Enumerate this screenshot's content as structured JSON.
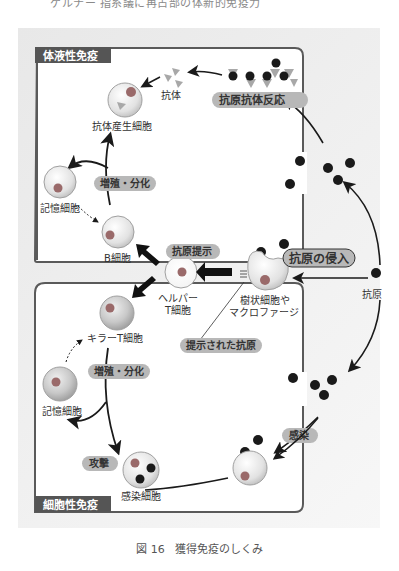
{
  "heading_cut": "ゲルナー 指系議に再占部の体新的免疫力",
  "sections": {
    "humoral": "体液性免疫",
    "cellular": "細胞性免疫"
  },
  "cells": {
    "antibody": "抗体",
    "plasma_cell": "抗体産生細胞",
    "memory_b": "記憶細胞",
    "b_cell": "B細胞",
    "helper_t_line1": "ヘルパー",
    "helper_t_line2": "T細胞",
    "dendritic_line1": "樹状細胞や",
    "dendritic_line2": "マクロファージ",
    "antigen": "抗原",
    "killer_t": "キラーT細胞",
    "memory_t": "記憶細胞",
    "infected_cell": "感染細胞"
  },
  "badges": {
    "ag_ab_reaction": "抗原抗体反応",
    "proliferation_humoral": "増殖・分化",
    "antigen_presentation": "抗原提示",
    "antigen_invasion": "抗原の侵入",
    "presented_antigen": "提示された抗原",
    "proliferation_cellular": "増殖・分化",
    "infection": "感染",
    "attack": "攻撃"
  },
  "caption": {
    "number": "図 16",
    "title": "獲得免疫のしくみ"
  },
  "colors": {
    "badge_bg": "#b8b8b8",
    "section_label_bg": "#555555",
    "border": "#5a5a5a",
    "nucleus": "#9a6a6a",
    "antibody": "#a8a8a8",
    "antigen": "#1a1a1a"
  }
}
